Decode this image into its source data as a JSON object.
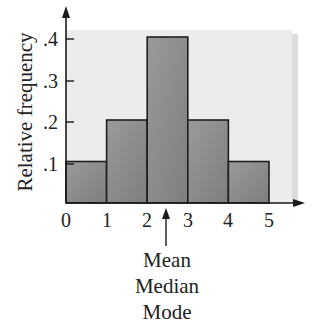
{
  "chart_data": {
    "type": "bar",
    "subtype": "histogram",
    "title": "",
    "xlabel": "",
    "ylabel": "Relative frequency",
    "bins": [
      [
        0,
        1
      ],
      [
        1,
        2
      ],
      [
        2,
        3
      ],
      [
        3,
        4
      ],
      [
        4,
        5
      ]
    ],
    "categories": [
      "0-1",
      "1-2",
      "2-3",
      "3-4",
      "4-5"
    ],
    "values": [
      0.1,
      0.2,
      0.4,
      0.2,
      0.1
    ],
    "x_ticks": [
      "0",
      "1",
      "2",
      "3",
      "4",
      "5"
    ],
    "y_ticks": [
      ".1",
      ".2",
      ".3",
      ".4"
    ],
    "xlim": [
      0,
      5.6
    ],
    "ylim": [
      0,
      0.45
    ],
    "grid": false,
    "legend": null,
    "annotations": [
      {
        "x": 2.5,
        "type": "arrow-up",
        "text": [
          "Mean",
          "Median",
          "Mode"
        ]
      }
    ]
  },
  "colors": {
    "bar_fill": "#8c8c8c",
    "bar_stroke": "#1e1e1e",
    "panel_bg": "#ececec",
    "axis": "#1a1a1a"
  },
  "annotation": {
    "line1": "Mean",
    "line2": "Median",
    "line3": "Mode"
  },
  "axis": {
    "ylabel": "Relative frequency",
    "x0": "0",
    "x1": "1",
    "x2": "2",
    "x3": "3",
    "x4": "4",
    "x5": "5",
    "y1": ".1",
    "y2": ".2",
    "y3": ".3",
    "y4": ".4"
  }
}
